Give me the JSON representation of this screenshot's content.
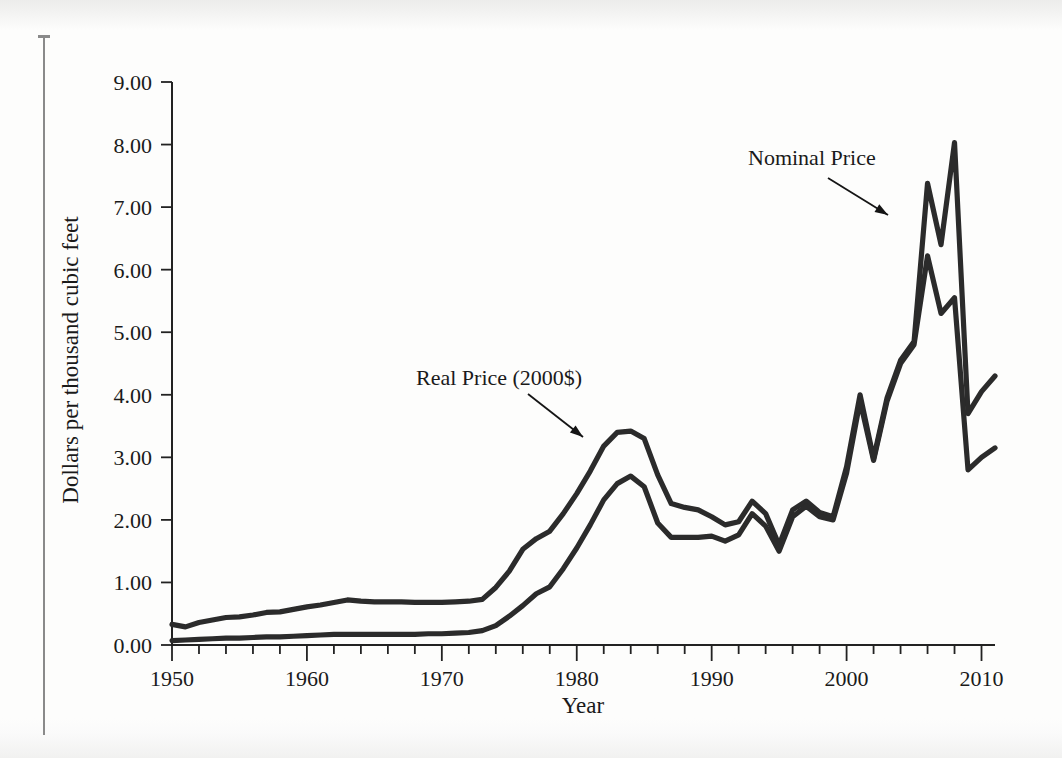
{
  "figure": {
    "y_axis_title": "Dollars per thousand cubic feet",
    "x_axis_title": "Year"
  },
  "annotations": {
    "nominal": "Nominal Price",
    "real": "Real Price (2000$)"
  },
  "axis": {
    "y_ticks": [
      "0.00",
      "1.00",
      "2.00",
      "3.00",
      "4.00",
      "5.00",
      "6.00",
      "7.00",
      "8.00",
      "9.00"
    ],
    "x_ticks": [
      "1950",
      "1960",
      "1970",
      "1980",
      "1990",
      "2000",
      "2010"
    ]
  },
  "colors": {
    "line": "#2b2b2b",
    "axis": "#222222",
    "text": "#1a1a1a",
    "page": "#fdfdfc"
  },
  "chart_data": {
    "type": "line",
    "title": "",
    "xlabel": "Year",
    "ylabel": "Dollars per thousand cubic feet",
    "xlim": [
      1950,
      2011
    ],
    "ylim": [
      0.0,
      9.0
    ],
    "ytick_values": [
      0,
      1,
      2,
      3,
      4,
      5,
      6,
      7,
      8,
      9
    ],
    "xtick_values": [
      1950,
      1960,
      1970,
      1980,
      1990,
      2000,
      2010
    ],
    "minor_xtick_interval": 2,
    "grid": false,
    "legend": "annotated-inline",
    "x": [
      1950,
      1951,
      1952,
      1953,
      1954,
      1955,
      1956,
      1957,
      1958,
      1959,
      1960,
      1961,
      1962,
      1963,
      1964,
      1965,
      1966,
      1967,
      1968,
      1969,
      1970,
      1971,
      1972,
      1973,
      1974,
      1975,
      1976,
      1977,
      1978,
      1979,
      1980,
      1981,
      1982,
      1983,
      1984,
      1985,
      1986,
      1987,
      1988,
      1989,
      1990,
      1991,
      1992,
      1993,
      1994,
      1995,
      1996,
      1997,
      1998,
      1999,
      2000,
      2001,
      2002,
      2003,
      2004,
      2005,
      2006,
      2007,
      2008,
      2009,
      2010,
      2011
    ],
    "series": [
      {
        "name": "Real Price (2000$)",
        "units": "2000 dollars per thousand cubic feet",
        "values": [
          0.33,
          0.29,
          0.36,
          0.4,
          0.44,
          0.45,
          0.48,
          0.52,
          0.53,
          0.57,
          0.61,
          0.64,
          0.68,
          0.72,
          0.7,
          0.69,
          0.69,
          0.69,
          0.68,
          0.68,
          0.68,
          0.69,
          0.7,
          0.73,
          0.92,
          1.18,
          1.53,
          1.7,
          1.82,
          2.1,
          2.42,
          2.78,
          3.18,
          3.4,
          3.42,
          3.3,
          2.72,
          2.26,
          2.2,
          2.16,
          2.05,
          1.92,
          1.97,
          2.3,
          2.1,
          1.6,
          2.16,
          2.3,
          2.12,
          2.05,
          2.85,
          4.0,
          2.98,
          3.95,
          4.55,
          4.85,
          7.38,
          6.4,
          8.03,
          3.7,
          4.05,
          4.3
        ]
      },
      {
        "name": "Nominal Price",
        "units": "current dollars per thousand cubic feet",
        "values": [
          0.07,
          0.08,
          0.09,
          0.1,
          0.11,
          0.11,
          0.12,
          0.13,
          0.13,
          0.14,
          0.15,
          0.16,
          0.17,
          0.17,
          0.17,
          0.17,
          0.17,
          0.17,
          0.17,
          0.18,
          0.18,
          0.19,
          0.2,
          0.23,
          0.31,
          0.46,
          0.63,
          0.82,
          0.93,
          1.22,
          1.55,
          1.92,
          2.32,
          2.58,
          2.7,
          2.53,
          1.95,
          1.72,
          1.72,
          1.72,
          1.74,
          1.66,
          1.76,
          2.1,
          1.9,
          1.5,
          2.05,
          2.22,
          2.05,
          2.0,
          2.75,
          3.9,
          2.95,
          3.9,
          4.5,
          4.8,
          6.22,
          5.3,
          5.55,
          2.8,
          3.0,
          3.15
        ]
      }
    ],
    "annotations": [
      {
        "text": "Nominal Price",
        "target_year": 2005,
        "target_value": 7.38
      },
      {
        "text": "Real Price (2000$)",
        "target_year": 1982,
        "target_value": 3.18
      }
    ]
  }
}
